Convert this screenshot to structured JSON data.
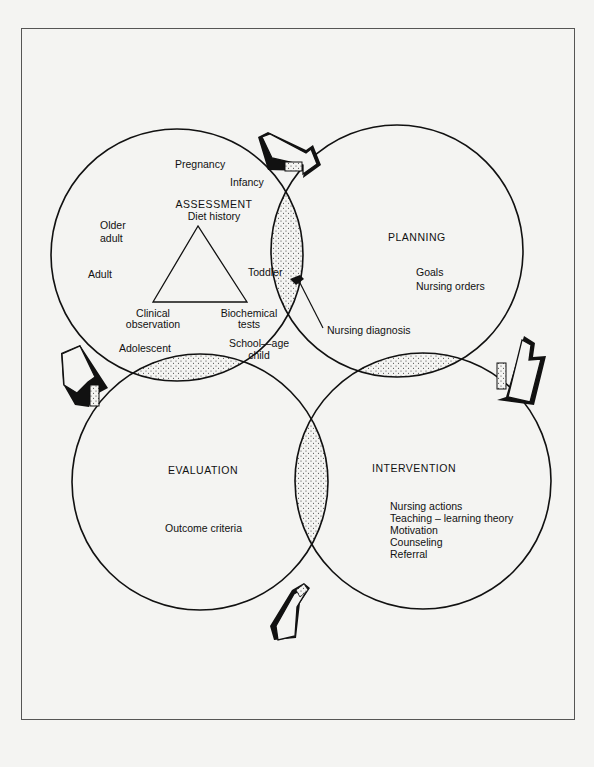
{
  "diagram": {
    "type": "four-circle nursing process cycle",
    "circles": {
      "assessment": {
        "title": "ASSESSMENT",
        "subtitle": "Diet history",
        "triangle_vertices": [
          "Diet history",
          "Clinical observation",
          "Biochemical tests"
        ],
        "life_stages": [
          "Pregnancy",
          "Infancy",
          "Toddler",
          "School—age child",
          "Adolescent",
          "Adult",
          "Older adult"
        ]
      },
      "planning": {
        "title": "PLANNING",
        "items": [
          "Goals",
          "Nursing orders"
        ]
      },
      "intervention": {
        "title": "INTERVENTION",
        "items": [
          "Nursing actions",
          "Teaching – learning theory",
          "Motivation",
          "Counseling",
          "Referral"
        ]
      },
      "evaluation": {
        "title": "EVALUATION",
        "items": [
          "Outcome criteria"
        ]
      }
    },
    "labels": {
      "pregnancy": "Pregnancy",
      "infancy": "Infancy",
      "older_adult_1": "Older",
      "older_adult_2": "adult",
      "adult": "Adult",
      "toddler": "Toddler",
      "clinical_1": "Clinical",
      "clinical_2": "observation",
      "biochem_1": "Biochemical",
      "biochem_2": "tests",
      "school_1": "School—age",
      "school_2": "child",
      "adolescent": "Adolescent",
      "nursing_diagnosis": "Nursing diagnosis"
    },
    "arrows": [
      "assessment-to-planning",
      "planning-to-intervention",
      "intervention-to-evaluation",
      "evaluation-to-assessment"
    ],
    "overlap_pattern": "stippled"
  }
}
